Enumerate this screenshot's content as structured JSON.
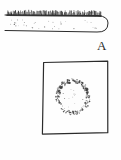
{
  "figure": {
    "kind": "scientific-line-drawing",
    "background_color": "#fefefe",
    "ink_color": "#2b2b2b",
    "width": 121,
    "height": 160,
    "panels": [
      {
        "id": "A",
        "label": "A",
        "label_x": 97,
        "label_y": 39,
        "subject": "elongated-blade-with-fringed-margin",
        "description": "Elongated horizontal body, flat on the left, rounded at the right end, with a dense fringe of short bristles along the entire upper margin and sparse stippling across the interior.",
        "outline": {
          "left_x": 5,
          "right_tip_x": 108,
          "top_y": 15,
          "bottom_y": 31,
          "rounded_end": "right"
        },
        "fringe": {
          "name": "bristle-fringe",
          "edge": "top",
          "count": 96,
          "start_x": 7,
          "end_x": 101,
          "base_y": 15,
          "min_length": 2,
          "max_length": 5
        },
        "stipple": {
          "name": "interior-stipple",
          "count": 34,
          "region_x": [
            10,
            99
          ],
          "region_y": [
            19,
            29
          ]
        }
      },
      {
        "id": "B",
        "label": "B",
        "label_x": 101,
        "label_y": 138,
        "subject": "granular-ovoid-in-square-frame",
        "description": "Hand-drawn square frame enclosing a roughly circular body with a dark granular rim and a pale interior bearing a few scattered dots.",
        "frame": {
          "name": "square-frame",
          "left": 43,
          "top": 62,
          "right": 108,
          "bottom": 133,
          "stroke_width": 1.2
        },
        "body": {
          "name": "granular-ovoid",
          "center_x": 73,
          "center_y": 97,
          "radius_x": 15,
          "radius_y": 16,
          "rim_granule_count": 170,
          "interior_dot_count": 12,
          "rim_color": "#3a3a3a",
          "interior_color": "#fdfdfd"
        }
      }
    ]
  },
  "chart_data": {
    "type": "table",
    "title": "",
    "categories": [
      "A",
      "B"
    ],
    "values": [
      1,
      1
    ],
    "series": [
      {
        "name": "panel-labels",
        "values": [
          "A",
          "B"
        ]
      }
    ],
    "xlabel": "",
    "ylabel": "",
    "annotations": [
      "A",
      "B"
    ]
  }
}
